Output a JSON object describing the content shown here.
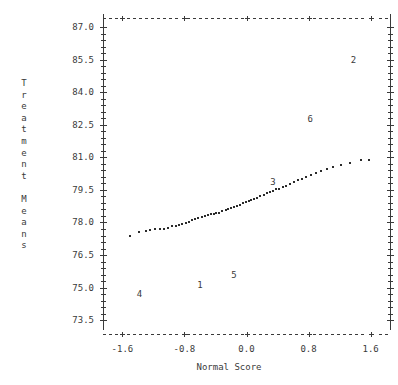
{
  "chart_data": {
    "type": "scatter",
    "title": "",
    "xlabel": "Normal Score",
    "ylabel": "Treatment Means",
    "ylabel_lines": [
      "Treatment",
      "Means"
    ],
    "xlim": [
      -1.85,
      1.85
    ],
    "ylim": [
      73.05,
      87.6
    ],
    "xticks": [
      -1.6,
      -0.8,
      0.0,
      0.8,
      1.6
    ],
    "xticklabels": [
      "-1.6",
      "-0.8",
      "0.0",
      "0.8",
      "1.6"
    ],
    "yticks": [
      73.5,
      75.0,
      76.5,
      78.0,
      79.5,
      81.0,
      82.5,
      84.0,
      85.5,
      87.0
    ],
    "yticklabels": [
      "73.5",
      "75.0",
      "76.5",
      "78.0",
      "79.5",
      "81.0",
      "82.5",
      "84.0",
      "85.5",
      "87.0"
    ],
    "grid": false,
    "legend": null,
    "marker": "dot",
    "x": [
      -1.5,
      -1.38,
      -1.3,
      -1.24,
      -1.18,
      -1.12,
      -1.06,
      -1.01,
      -0.96,
      -0.91,
      -0.87,
      -0.83,
      -0.78,
      -0.74,
      -0.7,
      -0.66,
      -0.62,
      -0.58,
      -0.54,
      -0.5,
      -0.46,
      -0.42,
      -0.39,
      -0.35,
      -0.31,
      -0.27,
      -0.24,
      -0.2,
      -0.16,
      -0.12,
      -0.09,
      -0.05,
      -0.01,
      0.03,
      0.06,
      0.1,
      0.14,
      0.18,
      0.22,
      0.26,
      0.3,
      0.34,
      0.38,
      0.42,
      0.47,
      0.51,
      0.56,
      0.61,
      0.66,
      0.71,
      0.77,
      0.83,
      0.89,
      0.96,
      1.04,
      1.12,
      1.22,
      1.33,
      1.48,
      1.58
    ],
    "y": [
      77.4,
      77.58,
      77.63,
      77.66,
      77.68,
      77.7,
      77.72,
      77.76,
      77.82,
      77.86,
      77.88,
      77.92,
      77.98,
      78.04,
      78.1,
      78.16,
      78.2,
      78.24,
      78.28,
      78.34,
      78.38,
      78.4,
      78.44,
      78.46,
      78.52,
      78.58,
      78.62,
      78.66,
      78.7,
      78.76,
      78.82,
      78.88,
      78.94,
      79.0,
      79.02,
      79.08,
      79.14,
      79.22,
      79.28,
      79.34,
      79.4,
      79.46,
      79.52,
      79.56,
      79.62,
      79.7,
      79.78,
      79.86,
      79.94,
      80.02,
      80.1,
      80.18,
      80.26,
      80.36,
      80.46,
      80.56,
      80.66,
      80.76,
      80.86,
      80.9
    ],
    "annotations": [
      {
        "label": "4",
        "x": -1.38,
        "y": 74.7
      },
      {
        "label": "1",
        "x": -0.6,
        "y": 75.1
      },
      {
        "label": "5",
        "x": -0.16,
        "y": 75.6
      },
      {
        "label": "3",
        "x": 0.34,
        "y": 79.85
      },
      {
        "label": "6",
        "x": 0.82,
        "y": 82.75
      },
      {
        "label": "2",
        "x": 1.38,
        "y": 85.5
      }
    ]
  },
  "axes": {
    "y_title": "Treatment Means",
    "x_title": "Normal Score"
  },
  "colors": {
    "ink": "#3a3a3a",
    "marker": "#2b2b2b",
    "background": "#ffffff"
  }
}
